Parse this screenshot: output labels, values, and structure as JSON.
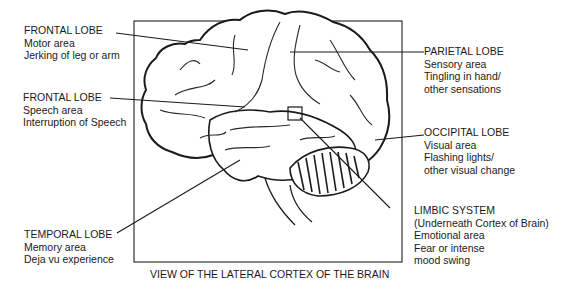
{
  "caption": "VIEW OF THE LATERAL CORTEX OF THE BRAIN",
  "labels": {
    "frontal_motor": {
      "title": "FRONTAL LOBE",
      "lines": [
        "Motor area",
        "Jerking of leg or arm"
      ]
    },
    "frontal_speech": {
      "title": "FRONTAL LOBE",
      "lines": [
        "Speech area",
        "Interruption of Speech"
      ]
    },
    "temporal": {
      "title": "TEMPORAL LOBE",
      "lines": [
        "Memory area",
        "Deja vu experience"
      ]
    },
    "parietal": {
      "title": "PARIETAL LOBE",
      "lines": [
        "Sensory area",
        "Tingling in hand/",
        "other sensations"
      ]
    },
    "occipital": {
      "title": "OCCIPITAL LOBE",
      "lines": [
        "Visual area",
        "Flashing lights/",
        "other visual change"
      ]
    },
    "limbic": {
      "title": "LIMBIC SYSTEM",
      "lines": [
        "(Underneath Cortex of Brain)",
        "Emotional area",
        "Fear or intense",
        "mood swing"
      ]
    }
  },
  "colors": {
    "ink": "#1a1a1a",
    "background": "#ffffff"
  }
}
